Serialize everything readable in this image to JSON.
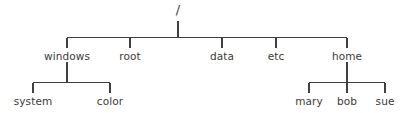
{
  "diagram": {
    "type": "filesystem-tree",
    "title": "",
    "background_color": "#ffffff",
    "line_color": "#3f3f3f",
    "text_color": "#3b3b3b",
    "root": {
      "label": "/",
      "x": 178,
      "y": 18
    },
    "level1": [
      {
        "label": "windows",
        "x": 67,
        "y": 60
      },
      {
        "label": "root",
        "x": 130,
        "y": 60
      },
      {
        "label": "data",
        "x": 222,
        "y": 60
      },
      {
        "label": "etc",
        "x": 276,
        "y": 60
      },
      {
        "label": "home",
        "x": 347,
        "y": 60
      }
    ],
    "level2": [
      {
        "label": "system",
        "parent": "windows",
        "x": 33,
        "y": 105
      },
      {
        "label": "color",
        "parent": "windows",
        "x": 110,
        "y": 105
      },
      {
        "label": "mary",
        "parent": "home",
        "x": 309,
        "y": 105
      },
      {
        "label": "bob",
        "parent": "home",
        "x": 347,
        "y": 105
      },
      {
        "label": "sue",
        "parent": "home",
        "x": 385,
        "y": 105
      }
    ],
    "edges": {
      "root_stem_top": 21,
      "root_stem_bottom": 37,
      "main_bar_y": 37,
      "main_bar_x1": 67,
      "main_bar_x2": 347,
      "level1_drop_bottom": 48,
      "windows_stem_top": 62,
      "windows_bar_y": 82,
      "windows_bar_x1": 33,
      "windows_bar_x2": 110,
      "home_stem_top": 62,
      "home_bar_y": 82,
      "home_bar_x1": 309,
      "home_bar_x2": 385,
      "level2_drop_bottom": 93
    }
  }
}
